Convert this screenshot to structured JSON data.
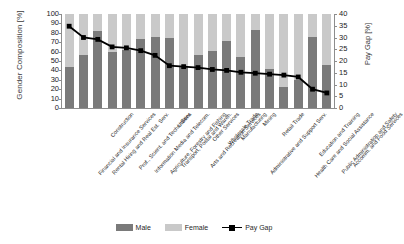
{
  "chart_data": {
    "type": "bar",
    "title": "",
    "subtitle": "",
    "xlabel": "",
    "ylabel": "Gender Composition [%]",
    "ylabel_secondary": "Pay Gap [%]",
    "ylim": [
      0,
      100
    ],
    "ylim_secondary": [
      0,
      40
    ],
    "yticks": [
      0,
      10,
      20,
      30,
      40,
      50,
      60,
      70,
      80,
      90,
      100
    ],
    "yticks_secondary": [
      0,
      5,
      10,
      15,
      20,
      25,
      30,
      35,
      40
    ],
    "grid": false,
    "legend_position": "bottom",
    "stacked": true,
    "categories": [
      "Financial and Insurance Services",
      "Rental Hiring and Real Est. Serv.",
      "Construction",
      "Prof., Scient. and Techn. Serv.",
      "Information Media and Telecom.",
      "Agriculture, Forestry and Fishing",
      "Transport, Postal and Wareh.",
      "Utilities",
      "Arts and Recreation Services",
      "Other Services",
      "Wholesale Trade",
      "Manufacturing",
      "Administrative and Support Serv.",
      "Mining",
      "Retail Trade",
      "Health Care and Social Assistance",
      "Education and Training",
      "Public Administration and Safety",
      "Accomm. and Food Services"
    ],
    "series": [
      {
        "name": "Male",
        "color": "#7a7a7a",
        "axis": "left",
        "values": [
          44,
          56,
          82,
          60,
          62,
          73,
          76,
          75,
          45,
          56,
          61,
          71,
          54,
          83,
          42,
          22,
          30,
          76,
          46
        ]
      },
      {
        "name": "Female",
        "color": "#c9c9c9",
        "axis": "left",
        "values": [
          56,
          44,
          18,
          40,
          38,
          27,
          24,
          25,
          55,
          44,
          39,
          29,
          46,
          17,
          58,
          78,
          70,
          24,
          54
        ]
      },
      {
        "name": "Pay Gap",
        "color": "#000000",
        "axis": "right",
        "type": "line",
        "values": [
          34.8,
          30.0,
          29.2,
          26.0,
          25.6,
          24.4,
          22.4,
          18.0,
          17.6,
          17.2,
          16.4,
          16.0,
          15.2,
          14.8,
          14.4,
          14.0,
          13.2,
          8.0,
          6.4
        ]
      }
    ]
  },
  "legend": {
    "items": [
      {
        "label": "Male",
        "swatch": "male-swatch"
      },
      {
        "label": "Female",
        "swatch": "female-swatch"
      },
      {
        "label": "Pay Gap",
        "swatch": "paygap-line-swatch"
      }
    ]
  }
}
